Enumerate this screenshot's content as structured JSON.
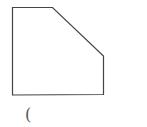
{
  "diagram": {
    "type": "polygon-figure",
    "shape": "pentagon",
    "stroke_color": "#444444",
    "fill_color": "#ffffff",
    "caption": "("
  }
}
